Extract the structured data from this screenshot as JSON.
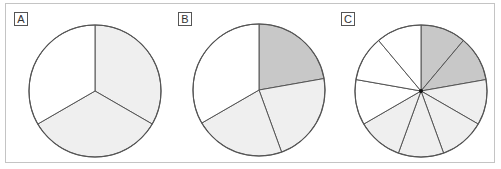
{
  "figure": {
    "frame_color": "#c4c4c4",
    "stroke_color": "#555555",
    "colors": {
      "dark": "#c8c8c8",
      "light": "#efefef",
      "white": "#ffffff"
    }
  },
  "panels": [
    {
      "label": "A",
      "label_pos": [
        14,
        12
      ],
      "center": [
        95,
        91
      ],
      "radius": 66,
      "center_dot": false,
      "slices": [
        {
          "start": 0,
          "end": 120,
          "fill": "light"
        },
        {
          "start": 120,
          "end": 240,
          "fill": "light"
        },
        {
          "start": 240,
          "end": 360,
          "fill": "white"
        }
      ]
    },
    {
      "label": "B",
      "label_pos": [
        178,
        12
      ],
      "center": [
        259,
        90
      ],
      "radius": 66,
      "center_dot": false,
      "slices": [
        {
          "start": 0,
          "end": 80,
          "fill": "dark"
        },
        {
          "start": 80,
          "end": 160,
          "fill": "light"
        },
        {
          "start": 160,
          "end": 240,
          "fill": "light"
        },
        {
          "start": 240,
          "end": 360,
          "fill": "white"
        }
      ]
    },
    {
      "label": "C",
      "label_pos": [
        341,
        12
      ],
      "center": [
        421,
        91
      ],
      "radius": 66,
      "center_dot": true,
      "slices": [
        {
          "start": 0,
          "end": 40,
          "fill": "dark"
        },
        {
          "start": 40,
          "end": 80,
          "fill": "dark"
        },
        {
          "start": 80,
          "end": 120,
          "fill": "light"
        },
        {
          "start": 120,
          "end": 160,
          "fill": "light"
        },
        {
          "start": 160,
          "end": 200,
          "fill": "light"
        },
        {
          "start": 200,
          "end": 240,
          "fill": "light"
        },
        {
          "start": 240,
          "end": 280,
          "fill": "white"
        },
        {
          "start": 280,
          "end": 320,
          "fill": "white"
        },
        {
          "start": 320,
          "end": 360,
          "fill": "white"
        }
      ]
    }
  ]
}
